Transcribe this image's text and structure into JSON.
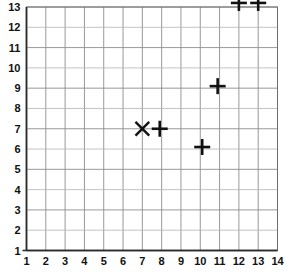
{
  "chart_data": {
    "type": "scatter",
    "title": "",
    "xlabel": "",
    "ylabel": "",
    "xlim": [
      1,
      14
    ],
    "ylim": [
      1,
      13.5
    ],
    "grid": true,
    "legend": null,
    "x_ticks": [
      "1",
      "2",
      "3",
      "4",
      "5",
      "6",
      "7",
      "8",
      "9",
      "10",
      "11",
      "12",
      "13",
      "14"
    ],
    "y_ticks": [
      "1",
      "2",
      "3",
      "4",
      "5",
      "6",
      "7",
      "8",
      "9",
      "10",
      "11",
      "12",
      "13"
    ],
    "x_tick_values": [
      1,
      2,
      3,
      4,
      5,
      6,
      7,
      8,
      9,
      10,
      11,
      12,
      13,
      14
    ],
    "y_tick_values": [
      1,
      2,
      3,
      4,
      5,
      6,
      7,
      8,
      9,
      10,
      11,
      12,
      13
    ],
    "points": [
      {
        "x": 7.0,
        "y": 7.0,
        "marker": "x"
      },
      {
        "x": 7.9,
        "y": 7.0,
        "marker": "plus"
      },
      {
        "x": 10.1,
        "y": 6.1,
        "marker": "plus"
      },
      {
        "x": 10.9,
        "y": 9.1,
        "marker": "plus"
      },
      {
        "x": 12.0,
        "y": 13.2,
        "marker": "plus"
      },
      {
        "x": 13.0,
        "y": 13.2,
        "marker": "plus"
      }
    ]
  },
  "colors": {
    "marker": "#111111",
    "grid": "#8d8d8d",
    "axis": "#2a2a2a",
    "background": "#ffffff"
  }
}
